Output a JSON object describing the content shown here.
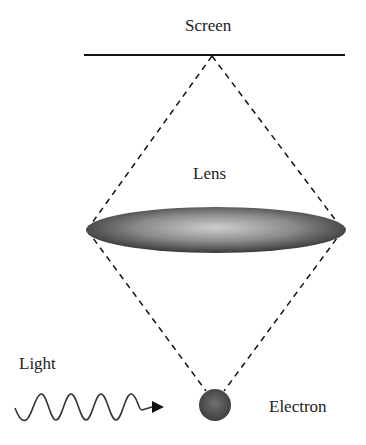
{
  "diagram": {
    "labels": {
      "screen": "Screen",
      "lens": "Lens",
      "light": "Light",
      "electron": "Electron"
    },
    "colors": {
      "line": "#111111",
      "lens_center": "#c8c8c8",
      "lens_edge": "#3a3a3a",
      "electron_center": "#6a6a6a",
      "electron_edge": "#3a3a3a",
      "wave": "#333333"
    },
    "elements": [
      {
        "id": "screen",
        "type": "line"
      },
      {
        "id": "lens",
        "type": "ellipse"
      },
      {
        "id": "electron",
        "type": "circle"
      },
      {
        "id": "light-wave",
        "type": "wave-arrow",
        "crests": 4
      },
      {
        "id": "ray-paths",
        "type": "dashed-lines",
        "count": 4
      }
    ]
  }
}
